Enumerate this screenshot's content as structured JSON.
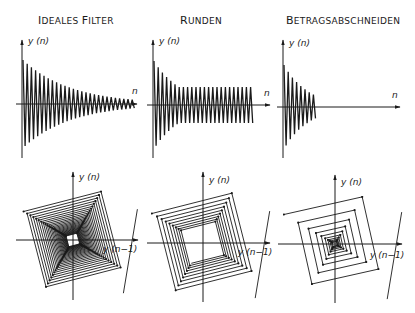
{
  "titles": {
    "ideal": "Ideales Filter",
    "round": "Runden",
    "clip": "Betragsabschneiden"
  },
  "labels": {
    "y_axis": "y (n)",
    "x_axis": "n",
    "phase_x": "y (n−1)"
  },
  "colors": {
    "ink": "#1a1a1a",
    "background": "#ffffff"
  },
  "panels": {
    "time": [
      {
        "id": "ideal",
        "origin": [
          22,
          104
        ],
        "x_end": 137,
        "y_top": 40,
        "y_bottom": 158,
        "amp0": 44,
        "decay": 0.915,
        "period": 4.2,
        "steps": 27,
        "limit": 0
      },
      {
        "id": "round",
        "origin": [
          153,
          105
        ],
        "x_end": 270,
        "y_top": 40,
        "y_bottom": 158,
        "amp0": 44,
        "decay": 0.86,
        "period": 4.2,
        "steps": 25,
        "limit": 18
      },
      {
        "id": "clip",
        "origin": [
          283,
          107
        ],
        "x_end": 400,
        "y_top": 40,
        "y_bottom": 158,
        "amp0": 42,
        "decay": 0.84,
        "period": 4.2,
        "steps": 8,
        "limit": 0
      }
    ],
    "phase": [
      {
        "id": "ideal",
        "origin": [
          73,
          240
        ],
        "x_range": [
          16,
          138
        ],
        "y_range": [
          172,
          300
        ],
        "r0": 56,
        "decay": 0.93,
        "turns": 28,
        "limit": 0
      },
      {
        "id": "round",
        "origin": [
          203,
          243
        ],
        "x_range": [
          147,
          270
        ],
        "y_range": [
          172,
          302
        ],
        "r0": 58,
        "decay": 0.9,
        "turns": 9,
        "limit": 20
      },
      {
        "id": "clip",
        "origin": [
          335,
          244
        ],
        "x_range": [
          278,
          402
        ],
        "y_range": [
          175,
          303
        ],
        "r0": 58,
        "decay": 0.72,
        "turns": 10,
        "limit": 0
      }
    ]
  }
}
